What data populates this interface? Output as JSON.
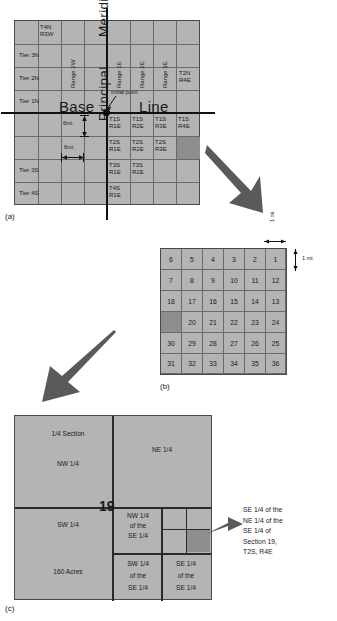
{
  "figure": {
    "captions": {
      "a": "(a)",
      "b": "(b)",
      "c": "(c)"
    }
  },
  "panel_a": {
    "name": "township-and-range-grid",
    "grid": {
      "cols": 8,
      "rows": 8
    },
    "base_line_label": "Base",
    "base_line_label2": "Line",
    "principal_meridian_upper": "Meridian",
    "principal_meridian_lower": "Principal",
    "initial_point_label": "Initial point",
    "tier_labels": [
      "Tier 3N",
      "Tier 2N",
      "Tier 1N",
      "Tier 3S",
      "Tier 4S"
    ],
    "corner_label": "T4N\nR3W",
    "corner_label_l1": "T4N",
    "corner_label_l2": "R3W",
    "ne_label_l1": "T2N",
    "ne_label_l2": "R4E",
    "range_labels": [
      "Range 2W",
      "Range 1E",
      "Range 2E",
      "Range 3E"
    ],
    "township_cells": [
      {
        "t": "T1S",
        "r": "R1E"
      },
      {
        "t": "T1S",
        "r": "R2E"
      },
      {
        "t": "T1S",
        "r": "R3E"
      },
      {
        "t": "T1S",
        "r": "R4E"
      },
      {
        "t": "T2S",
        "r": "R1E"
      },
      {
        "t": "T2S",
        "r": "R2E"
      },
      {
        "t": "T2S",
        "r": "R3E"
      },
      {
        "t": "T3S",
        "r": "R1E"
      },
      {
        "t": "T3S",
        "r": "R2E"
      },
      {
        "t": "T4S",
        "r": "R1E"
      }
    ],
    "dim_vertical": "6mi.",
    "dim_horizontal": "6mi.",
    "highlight": "T2S R4E"
  },
  "panel_b": {
    "name": "section-numbering-grid",
    "rows": [
      [
        "6",
        "5",
        "4",
        "3",
        "2",
        "1"
      ],
      [
        "7",
        "8",
        "9",
        "10",
        "11",
        "12"
      ],
      [
        "18",
        "17",
        "16",
        "15",
        "14",
        "13"
      ],
      [
        "",
        "20",
        "21",
        "22",
        "23",
        "24"
      ],
      [
        "30",
        "29",
        "28",
        "27",
        "26",
        "25"
      ],
      [
        "31",
        "32",
        "33",
        "34",
        "35",
        "36"
      ]
    ],
    "highlight_cell": {
      "row": 3,
      "col": 0,
      "implied_number": "19"
    },
    "dim_top": "1 mi.",
    "dim_right": "1 mi."
  },
  "panel_c": {
    "name": "section-subdivision-diagram",
    "section_number": "19",
    "nw_quarter_top": "1/4 Section",
    "nw_quarter_label": "NW 1/4",
    "ne_quarter_label": "NE 1/4",
    "sw_quarter_label": "SW 1/4",
    "sw_quarter_acres": "160 Acres",
    "nw_of_se": "NW 1/4\nof the\nSE 1/4",
    "nw_of_se_l1": "NW 1/4",
    "nw_of_se_l2": "of the",
    "nw_of_se_l3": "SE 1/4",
    "sw_of_se_l1": "SW 1/4",
    "sw_of_se_l2": "of the",
    "sw_of_se_l3": "SE 1/4",
    "se_of_se_l1": "SE 1/4",
    "se_of_se_l2": "of the",
    "se_of_se_l3": "SE 1/4",
    "callout": "SE 1/4 of the NE 1/4 of the SE 1/4 of Section 19, T2S, R4E",
    "callout_lines": [
      "SE 1/4 of the",
      "NE 1/4 of the",
      "SE 1/4 of",
      "Section 19,",
      "T2S, R4E"
    ]
  },
  "colors": {
    "fill": "#b4b4b4",
    "highlight": "#8e8e8e",
    "grid_line": "#6a6a6a",
    "heavy_line": "#111111",
    "arrow": "#555555"
  }
}
